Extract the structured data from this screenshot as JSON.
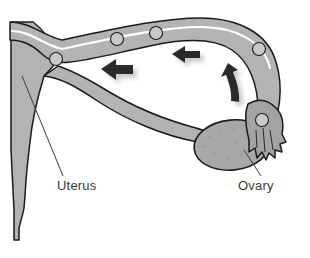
{
  "figure": {
    "background_color": "#ffffff",
    "width": 310,
    "height": 258
  },
  "labels": [
    {
      "id": "uterus",
      "text": "Uterus",
      "x": 57,
      "y": 190,
      "leader_from_x": 22,
      "leader_from_y": 76,
      "leader_to_x": 63,
      "leader_to_y": 176
    },
    {
      "id": "ovary",
      "text": "Ovary",
      "x": 238,
      "y": 190,
      "leader_from_x": 244,
      "leader_from_y": 150,
      "leader_to_x": 261,
      "leader_to_y": 176
    }
  ],
  "colors": {
    "tissue_fill": "#b3b3b3",
    "tissue_fill_dark": "#a3a3a3",
    "ovary_fill": "#a8a8a8",
    "ovum_fill": "#c9c9c9",
    "outline": "#1a1a1a",
    "lumen": "#ffffff",
    "arrow_fill": "#2b2b2b",
    "arrow_shadow": "#8c8c8c",
    "label_color": "#3b3b3b",
    "leader_line": "#3b3b3b"
  },
  "ova": [
    {
      "id": "ovum-1",
      "cx": 56,
      "cy": 59,
      "r": 6.5
    },
    {
      "id": "ovum-2",
      "cx": 117,
      "cy": 39,
      "r": 6.5
    },
    {
      "id": "ovum-3",
      "cx": 156,
      "cy": 33,
      "r": 6.5
    },
    {
      "id": "ovum-4",
      "cx": 259,
      "cy": 49,
      "r": 6.5
    },
    {
      "id": "ovum-5",
      "cx": 262,
      "cy": 120,
      "r": 6.5
    }
  ],
  "arrows": [
    {
      "id": "transport-arrow-near-uterus",
      "type": "straight-left",
      "tip_x": 101,
      "tip_y": 69
    },
    {
      "id": "transport-arrow-mid-tube",
      "type": "straight-left",
      "tip_x": 172,
      "tip_y": 54
    },
    {
      "id": "ovulation-arrow",
      "type": "curved-up-left",
      "tip_x": 228,
      "tip_y": 63
    }
  ],
  "structures": [
    {
      "id": "uterus-body",
      "name": "uterus-body"
    },
    {
      "id": "fallopian-tube",
      "name": "fallopian-tube"
    },
    {
      "id": "tube-lumen",
      "name": "tube-lumen"
    },
    {
      "id": "ovary-body",
      "name": "ovary-body"
    },
    {
      "id": "fimbriae",
      "name": "fimbriae"
    }
  ]
}
